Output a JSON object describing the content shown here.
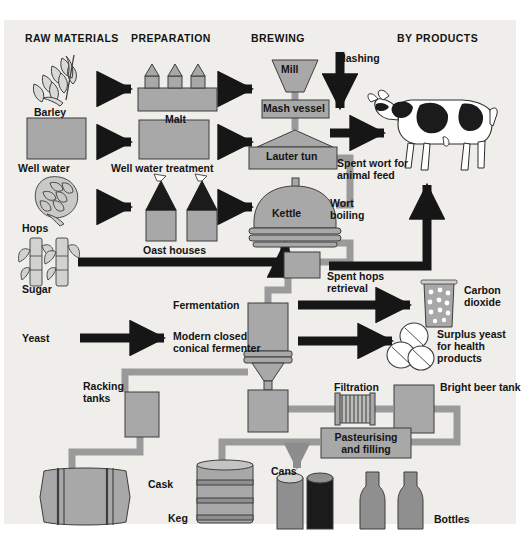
{
  "diagram": {
    "background_color": "#efeeea",
    "page_color": "#ffffff",
    "fill_gray": "#a8a8a8",
    "pipe_gray": "#9a9a9a",
    "arrow_black": "#161616",
    "outline": "#3d3d3d",
    "text_color": "#141414"
  },
  "headers": [
    {
      "id": "raw-materials",
      "label": "RAW MATERIALS",
      "x": 25,
      "y": 38
    },
    {
      "id": "preparation",
      "label": "PREPARATION",
      "x": 131,
      "y": 38
    },
    {
      "id": "brewing",
      "label": "BREWING",
      "x": 251,
      "y": 38
    },
    {
      "id": "by-products",
      "label": "BY PRODUCTS",
      "x": 397,
      "y": 38
    }
  ],
  "raw_materials": [
    {
      "id": "barley",
      "label": "Barley",
      "icon": "wheat-ear-icon",
      "x": 34,
      "y": 113
    },
    {
      "id": "well-water",
      "label": "Well water",
      "icon": "water-block-icon",
      "x": 18,
      "y": 168
    },
    {
      "id": "hops",
      "label": "Hops",
      "icon": "hop-cone-icon",
      "x": 22,
      "y": 228
    },
    {
      "id": "sugar",
      "label": "Sugar",
      "icon": "sugar-cane-icon",
      "x": 22,
      "y": 289
    },
    {
      "id": "yeast",
      "label": "Yeast",
      "icon": "yeast-text-icon",
      "x": 22,
      "y": 340
    }
  ],
  "preparation": [
    {
      "id": "malt",
      "label": "Malt",
      "icon": "malt-kiln-icon",
      "x": 155,
      "y": 116
    },
    {
      "id": "well-water-treatment",
      "label": "Well water treatment",
      "icon": "treatment-box-icon",
      "x": 111,
      "y": 168
    },
    {
      "id": "oast-houses",
      "label": "Oast houses",
      "icon": "oast-house-icon",
      "x": 143,
      "y": 248
    },
    {
      "id": "fermentation",
      "label": "Fermentation",
      "icon": "",
      "x": 173,
      "y": 308
    },
    {
      "id": "modern-closed-conical-fermenter",
      "label": "Modern closed\nconical fermenter",
      "icon": "conical-fermenter-icon",
      "x": 173,
      "y": 339
    }
  ],
  "brewing": [
    {
      "id": "mill",
      "label": "Mill",
      "icon": "mill-hopper-icon",
      "x": 288,
      "y": 69
    },
    {
      "id": "mash-vessel",
      "label": "Mash vessel",
      "icon": "mash-vessel-icon",
      "x": 287,
      "y": 104
    },
    {
      "id": "lauter-tun",
      "label": "Lauter tun",
      "icon": "lauter-tun-icon",
      "x": 287,
      "y": 155
    },
    {
      "id": "kettle",
      "label": "Kettle",
      "icon": "kettle-icon",
      "x": 287,
      "y": 213
    },
    {
      "id": "mashing",
      "label": "Mashing",
      "icon": "down-arrow-icon",
      "x": 337,
      "y": 59
    },
    {
      "id": "wort-boiling",
      "label": "Wort\nboiling",
      "icon": "",
      "x": 330,
      "y": 201
    },
    {
      "id": "spent-hops-retrieval",
      "label": "Spent hops\nretrieval",
      "icon": "spent-hops-box-icon",
      "x": 327,
      "y": 276
    }
  ],
  "by_products": [
    {
      "id": "spent-wort-animal-feed",
      "label": "Spent wort for\nanimal feed",
      "icon": "cow-icon",
      "x": 337,
      "y": 163
    },
    {
      "id": "carbon-dioxide",
      "label": "Carbon\ndioxide",
      "icon": "beaker-icon",
      "x": 467,
      "y": 290
    },
    {
      "id": "surplus-yeast",
      "label": "Surplus yeast\nfor health\nproducts",
      "icon": "yeast-tablets-icon",
      "x": 437,
      "y": 332
    }
  ],
  "packaging": [
    {
      "id": "racking-tanks",
      "label": "Racking\ntanks",
      "icon": "racking-tank-icon",
      "x": 85,
      "y": 385
    },
    {
      "id": "filtration",
      "label": "Filtration",
      "icon": "filter-icon",
      "x": 334,
      "y": 386
    },
    {
      "id": "bright-beer-tank",
      "label": "Bright beer tank",
      "icon": "bright-beer-tank-icon",
      "x": 420,
      "y": 386
    },
    {
      "id": "pasteurising-and-filling",
      "label": "Pasteurising\nand filling",
      "icon": "pasteuriser-icon",
      "x": 328,
      "y": 438
    },
    {
      "id": "cask",
      "label": "Cask",
      "icon": "cask-icon",
      "x": 153,
      "y": 483
    },
    {
      "id": "keg",
      "label": "Keg",
      "icon": "keg-icon",
      "x": 197,
      "y": 517
    },
    {
      "id": "cans",
      "label": "Cans",
      "icon": "can-icon",
      "x": 271,
      "y": 473
    },
    {
      "id": "bottles",
      "label": "Bottles",
      "icon": "bottle-icon",
      "x": 463,
      "y": 518
    }
  ],
  "flow_arrows": [
    {
      "id": "barley-to-malt",
      "from": "barley",
      "to": "malt",
      "style": "black-thick"
    },
    {
      "id": "wellwater-to-treatment",
      "from": "well-water",
      "to": "well-water-treatment",
      "style": "black-thick"
    },
    {
      "id": "hops-to-oast",
      "from": "hops",
      "to": "oast-houses",
      "style": "black-thick"
    },
    {
      "id": "malt-to-mill",
      "from": "malt",
      "to": "mill",
      "style": "black-thick"
    },
    {
      "id": "treatment-to-lautertun",
      "from": "well-water-treatment",
      "to": "lauter-tun",
      "style": "black-thick"
    },
    {
      "id": "oast-to-kettle",
      "from": "oast-houses",
      "to": "kettle",
      "style": "black-thick"
    },
    {
      "id": "sugar-to-kettle",
      "from": "sugar",
      "to": "kettle",
      "style": "black-elbow-up"
    },
    {
      "id": "yeast-to-fermenter",
      "from": "yeast",
      "to": "modern-closed-conical-fermenter",
      "style": "black-thick"
    },
    {
      "id": "mashing-down",
      "from": "mash-vessel",
      "to": "lauter-tun",
      "style": "black-down"
    },
    {
      "id": "lautertun-to-cow",
      "from": "lauter-tun",
      "to": "spent-wort-animal-feed",
      "style": "black-thick"
    },
    {
      "id": "spenthops-to-cow",
      "from": "spent-hops-retrieval",
      "to": "spent-wort-animal-feed",
      "style": "black-elbow-up"
    },
    {
      "id": "fermenter-to-co2",
      "from": "modern-closed-conical-fermenter",
      "to": "carbon-dioxide",
      "style": "black-thick"
    },
    {
      "id": "fermenter-to-yeast",
      "from": "modern-closed-conical-fermenter",
      "to": "surplus-yeast",
      "style": "black-thick"
    },
    {
      "id": "pasteuriser-to-cans",
      "from": "pasteurising-and-filling",
      "to": "cans",
      "style": "gray-down"
    }
  ]
}
